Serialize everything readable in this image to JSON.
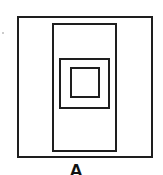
{
  "figure": {
    "label": "A",
    "line_color": "#1e1e1e",
    "shapes": [
      {
        "name": "outer-rectangle",
        "x": 17,
        "y": 16,
        "w": 136,
        "h": 142
      },
      {
        "name": "tall-inner-rectangle",
        "x": 52,
        "y": 23,
        "w": 65,
        "h": 129
      },
      {
        "name": "middle-square",
        "x": 59,
        "y": 58,
        "w": 51,
        "h": 51
      },
      {
        "name": "inner-square",
        "x": 70,
        "y": 67,
        "w": 30,
        "h": 31
      }
    ]
  }
}
